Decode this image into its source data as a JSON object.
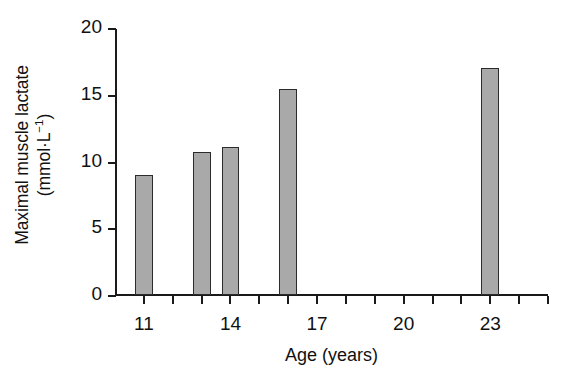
{
  "chart_data": {
    "type": "bar",
    "title": "",
    "subtitle": "",
    "xlabel": "Age (years)",
    "ylabel_line1": "Maximal muscle lactate",
    "ylabel_line2_prefix": "(mmol·L",
    "ylabel_line2_sup": "−1",
    "ylabel_line2_suffix": ")",
    "ylabel_full": "Maximal muscle lactate (mmol·L−1)",
    "x": [
      11,
      13,
      14,
      16,
      23
    ],
    "categories": [
      "11",
      "13",
      "14",
      "16",
      "23"
    ],
    "values": [
      9.0,
      10.7,
      11.1,
      15.4,
      17.0
    ],
    "xlim": [
      10,
      25
    ],
    "ylim": [
      0,
      20
    ],
    "y_ticks": [
      0,
      5,
      10,
      15,
      20
    ],
    "y_tick_labels": [
      "0",
      "5",
      "10",
      "15",
      "20"
    ],
    "x_ticks": [
      11,
      12,
      13,
      14,
      15,
      16,
      17,
      18,
      19,
      20,
      21,
      22,
      23,
      24,
      25
    ],
    "x_tick_labels_shown": [
      "11",
      "14",
      "17",
      "20",
      "23"
    ],
    "x_labeled_ticks": [
      11,
      14,
      17,
      20,
      23
    ],
    "grid": false,
    "legend": false,
    "legend_position": "none",
    "bar_width_years": 0.62,
    "colors": {
      "bar_fill": "#a9a9a9",
      "bar_edge": "#2b2b2b",
      "axis": "#1a1a1a",
      "text": "#111111",
      "background": "#ffffff"
    }
  }
}
